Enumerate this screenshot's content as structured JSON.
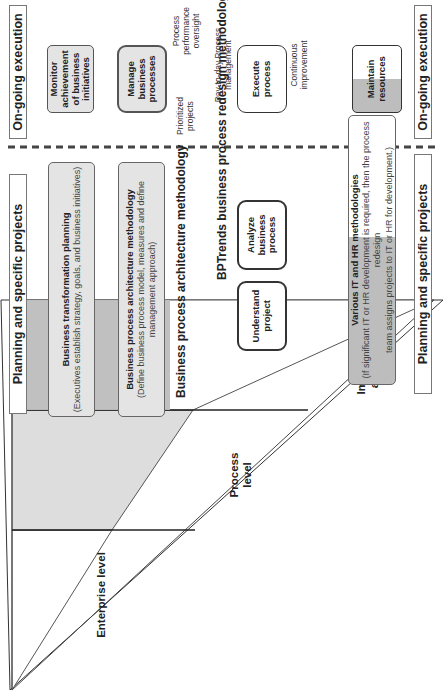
{
  "headers": {
    "planning_top": "Planning and specific projects",
    "execution_top": "On-going execution",
    "planning_bottom": "Planning and specific projects",
    "execution_bottom": "On-going execution"
  },
  "pyramid": {
    "levels": [
      {
        "label": "Enterprise level"
      },
      {
        "label": "Process level"
      },
      {
        "label": "Implementation and resource level"
      }
    ]
  },
  "bands": {
    "transformation": {
      "title": "Business transformation planning",
      "subtitle": "(Executives establish strategy, goals, and business initiatives)"
    },
    "architecture": {
      "title": "Business process architecture methodology",
      "subtitle": "(Define business process model, measures and define management approach)"
    },
    "it_hr": {
      "title": "Various IT and HR methodologies",
      "subtitle_line1": "(If significant IT or HR development is required, then the process redesign",
      "subtitle_line2": "team assigns projects to IT or HR for development.)"
    }
  },
  "sections": {
    "architecture_title": "Business process architecture methodology",
    "redesign_title": "BPTrends business process redesign methodology"
  },
  "redesign_steps": [
    {
      "label": "Understand project"
    },
    {
      "label": "Analyze business process"
    },
    {
      "label": "Redesign business process"
    },
    {
      "label": "Implement redesigned process"
    },
    {
      "label": "Roll-out redesigned process"
    }
  ],
  "execution_boxes": {
    "monitor": "Monitor achievement of business initiatives",
    "manage": "Manage business processes",
    "execute": "Execute process",
    "maintain": "Maintain resources"
  },
  "annotations": {
    "prioritized": "Prioritized projects",
    "performance": "Process performance oversight",
    "day_to_day": "Day-to-day Process management",
    "continuous": "Continuous improvement"
  },
  "colors": {
    "band_gray": "#e4e4e4",
    "dark_gray": "#bdbdbd",
    "border": "#333333"
  }
}
